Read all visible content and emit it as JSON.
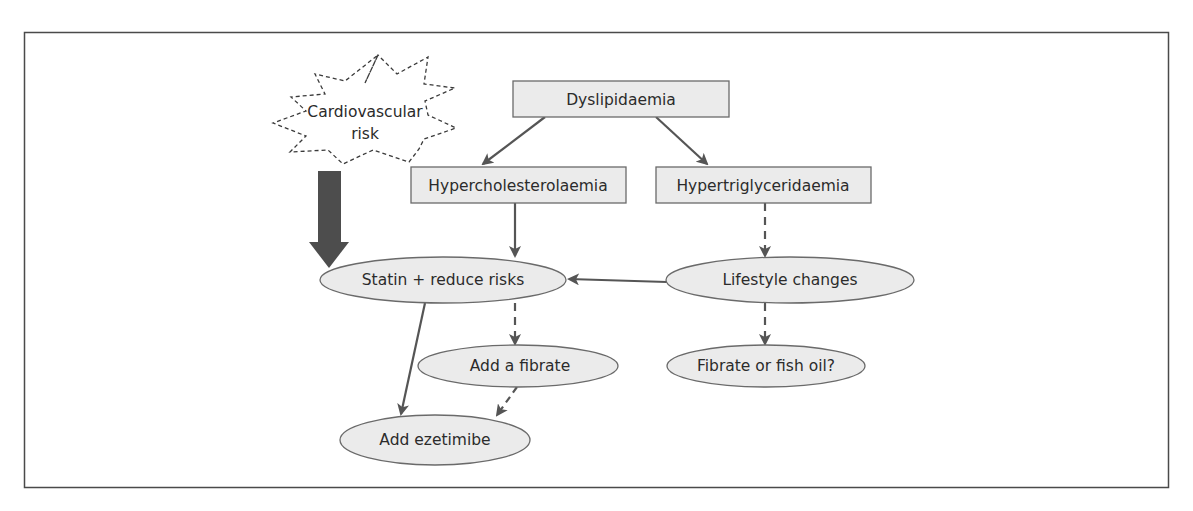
{
  "diagram": {
    "colors": {
      "frame": "#4a4a4a",
      "node_fill": "#ebebeb",
      "node_stroke": "#6a6a6a",
      "arrow": "#555555",
      "thick_arrow": "#4d4d4d",
      "text": "#2b2b2b"
    },
    "nodes": {
      "cardiovascular_risk": {
        "line1": "Cardiovascular",
        "line2": "risk",
        "shape": "starburst-dashed"
      },
      "dyslipidaemia": {
        "label": "Dyslipidaemia",
        "shape": "rectangle"
      },
      "hypercholesterolaemia": {
        "label": "Hypercholesterolaemia",
        "shape": "rectangle"
      },
      "hypertriglyceridaemia": {
        "label": "Hypertriglyceridaemia",
        "shape": "rectangle"
      },
      "statin": {
        "label": "Statin + reduce risks",
        "shape": "ellipse"
      },
      "lifestyle": {
        "label": "Lifestyle changes",
        "shape": "ellipse"
      },
      "add_fibrate": {
        "label": "Add a fibrate",
        "shape": "ellipse"
      },
      "fibrate_fish_oil": {
        "label": "Fibrate or fish oil?",
        "shape": "ellipse"
      },
      "add_ezetimibe": {
        "label": "Add ezetimibe",
        "shape": "ellipse"
      }
    },
    "edges": [
      {
        "from": "dyslipidaemia",
        "to": "hypercholesterolaemia",
        "style": "solid"
      },
      {
        "from": "dyslipidaemia",
        "to": "hypertriglyceridaemia",
        "style": "solid"
      },
      {
        "from": "cardiovascular_risk",
        "to": "statin",
        "style": "thick"
      },
      {
        "from": "hypercholesterolaemia",
        "to": "statin",
        "style": "solid"
      },
      {
        "from": "hypertriglyceridaemia",
        "to": "lifestyle",
        "style": "dashed"
      },
      {
        "from": "lifestyle",
        "to": "statin",
        "style": "solid"
      },
      {
        "from": "statin",
        "to": "add_fibrate",
        "style": "dashed"
      },
      {
        "from": "statin",
        "to": "add_ezetimibe",
        "style": "solid"
      },
      {
        "from": "lifestyle",
        "to": "fibrate_fish_oil",
        "style": "dashed"
      },
      {
        "from": "add_fibrate",
        "to": "add_ezetimibe",
        "style": "dashed"
      }
    ]
  }
}
